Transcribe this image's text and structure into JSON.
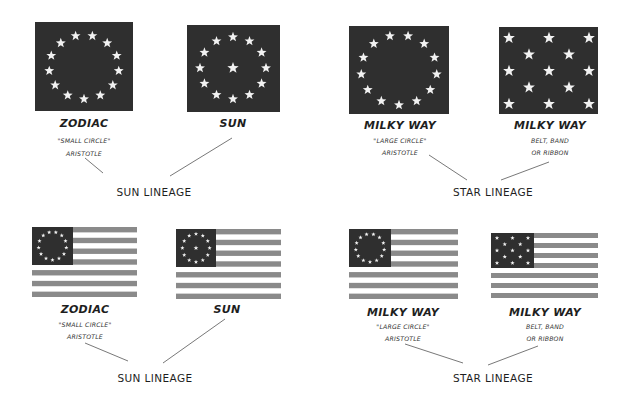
{
  "colors": {
    "canton": "#2f2f2f",
    "stripe": "#8a8a8a",
    "star": "#f2f2f2",
    "background": "#ffffff",
    "text": "#1e1e1e",
    "connector": "#555555"
  },
  "rows": [
    {
      "type": "canton-only",
      "groups": [
        {
          "lineage_label": "SUN LINEAGE",
          "panels": [
            {
              "title": "ZODIAC",
              "sub": [
                "\"SMALL CIRCLE\"",
                "ARISTOTLE"
              ],
              "pattern": "ring-13"
            },
            {
              "title": "SUN",
              "sub": [],
              "pattern": "ring-12-plus-center"
            }
          ]
        },
        {
          "lineage_label": "STAR LINEAGE",
          "panels": [
            {
              "title": "MILKY WAY",
              "sub": [
                "\"LARGE CIRCLE\"",
                "ARISTOTLE"
              ],
              "pattern": "ring-13"
            },
            {
              "title": "MILKY WAY",
              "sub": [
                "BELT, BAND",
                "OR RIBBON"
              ],
              "pattern": "staggered-rows-3-2-3-2-3"
            }
          ]
        }
      ]
    },
    {
      "type": "full-flag",
      "groups": [
        {
          "lineage_label": "SUN LINEAGE",
          "panels": [
            {
              "title": "ZODIAC",
              "sub": [
                "\"SMALL CIRCLE\"",
                "ARISTOTLE"
              ],
              "pattern": "ring-13"
            },
            {
              "title": "SUN",
              "sub": [],
              "pattern": "ring-12-plus-center"
            }
          ]
        },
        {
          "lineage_label": "STAR LINEAGE",
          "panels": [
            {
              "title": "MILKY WAY",
              "sub": [
                "\"LARGE CIRCLE\"",
                "ARISTOTLE"
              ],
              "pattern": "ring-13"
            },
            {
              "title": "MILKY WAY",
              "sub": [
                "BELT, BAND",
                "OR RIBBON"
              ],
              "pattern": "staggered-rows-3-2-3-2-3"
            }
          ]
        }
      ]
    }
  ]
}
